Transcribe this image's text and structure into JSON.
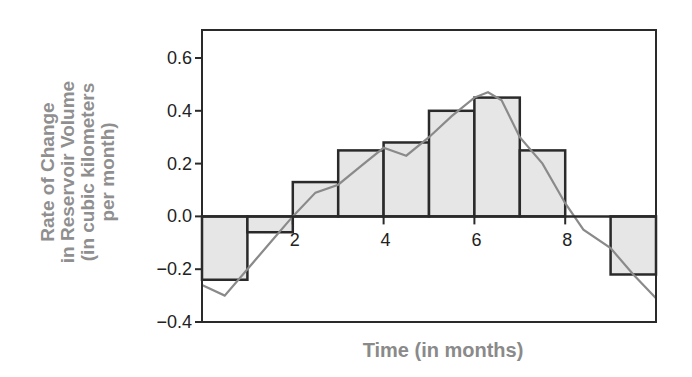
{
  "chart_data": {
    "type": "bar",
    "title": "",
    "xlabel": "Time (in months)",
    "ylabel": [
      "Rate of Change",
      "in Reservoir Volume",
      "(in cubic kilometers",
      "per month)"
    ],
    "xlim": [
      0,
      10
    ],
    "ylim": [
      -0.4,
      0.7
    ],
    "x_ticks": [
      "2",
      "4",
      "6",
      "8"
    ],
    "y_ticks": [
      "0.6",
      "0.4",
      "0.2",
      "0.0",
      "−0.2",
      "−0.4"
    ],
    "grid": false,
    "categories": [
      "0-1",
      "1-2",
      "2-3",
      "3-4",
      "4-5",
      "5-6",
      "6-7",
      "7-8",
      "8-9",
      "9-10"
    ],
    "series": [
      {
        "name": "Monthly average rate (bars)",
        "values": [
          -0.24,
          -0.06,
          0.13,
          0.25,
          0.28,
          0.4,
          0.45,
          0.25,
          0.0,
          -0.22
        ]
      },
      {
        "name": "Continuous rate (curve)",
        "x": [
          0,
          0.5,
          1,
          1.5,
          2,
          2.5,
          3,
          3.5,
          4,
          4.5,
          5,
          5.5,
          6,
          6.3,
          6.6,
          7,
          7.5,
          8,
          8.4,
          9,
          9.5,
          10
        ],
        "values": [
          -0.26,
          -0.3,
          -0.2,
          -0.1,
          0.0,
          0.09,
          0.12,
          0.19,
          0.26,
          0.23,
          0.3,
          0.38,
          0.45,
          0.47,
          0.44,
          0.3,
          0.2,
          0.05,
          -0.05,
          -0.12,
          -0.22,
          -0.31
        ]
      }
    ],
    "colors": {
      "bar_fill": "#e6e6e6",
      "bar_edge": "#2a2a2a",
      "curve": "#8a8a8a",
      "label": "#8f8f8f"
    }
  }
}
